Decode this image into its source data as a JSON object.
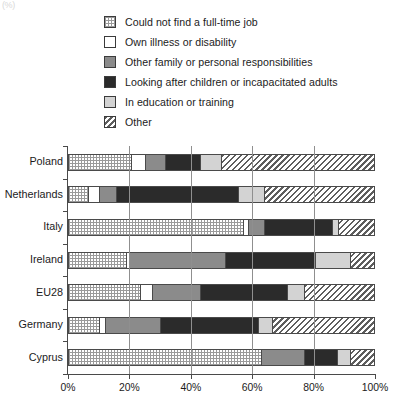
{
  "corner_artifact": "(%)",
  "chart_data": {
    "type": "bar",
    "orientation": "horizontal",
    "stacked": true,
    "normalized": true,
    "title": "",
    "subtitle": "",
    "xlabel": "",
    "ylabel": "",
    "xlim": [
      0,
      100
    ],
    "grid": true,
    "legend_position": "top",
    "xticks": [
      "0%",
      "20%",
      "40%",
      "60%",
      "80%",
      "100%"
    ],
    "xtick_values": [
      0,
      20,
      40,
      60,
      80,
      100
    ],
    "categories": [
      "Poland",
      "Netherlands",
      "Italy",
      "Ireland",
      "EU28",
      "Germany",
      "Cyprus"
    ],
    "series": [
      {
        "name": "Could not find a full-time job",
        "pattern": "dotted",
        "values": [
          20.5,
          6.5,
          57.0,
          19.0,
          23.5,
          10.0,
          63.0
        ]
      },
      {
        "name": "Own illness or disability",
        "pattern": "white",
        "values": [
          4.5,
          3.5,
          1.5,
          1.0,
          4.0,
          2.0,
          0.0
        ]
      },
      {
        "name": "Other family or personal responsibilities",
        "pattern": "gray",
        "values": [
          6.5,
          5.5,
          5.5,
          31.0,
          15.5,
          18.0,
          14.0
        ]
      },
      {
        "name": "Looking after children or incapacitated adults",
        "pattern": "black",
        "values": [
          11.5,
          40.0,
          22.0,
          29.5,
          28.5,
          32.0,
          10.5
        ]
      },
      {
        "name": "In education or training",
        "pattern": "lightgray",
        "values": [
          7.0,
          8.5,
          2.0,
          11.5,
          5.5,
          4.5,
          4.5
        ]
      },
      {
        "name": "Other",
        "pattern": "hatch",
        "values": [
          50.0,
          36.0,
          12.0,
          8.0,
          23.0,
          33.5,
          8.0
        ]
      }
    ]
  },
  "legend": {
    "items": [
      {
        "label": "Could not find a full-time job",
        "pattern": "dotted"
      },
      {
        "label": "Own illness or disability",
        "pattern": "white"
      },
      {
        "label": "Other family or personal responsibilities",
        "pattern": "gray"
      },
      {
        "label": "Looking after children or incapacitated adults",
        "pattern": "black"
      },
      {
        "label": "In education or training",
        "pattern": "lightgray"
      },
      {
        "label": "Other",
        "pattern": "hatch"
      }
    ]
  },
  "colors": {
    "dotted": "#9a9a9a",
    "white": "#ffffff",
    "gray": "#8b8b8b",
    "black": "#2b2b2b",
    "lightgray": "#d3d3d3",
    "hatch": "#5e5e5e",
    "axis": "#4a4a4a",
    "grid": "#8f8f8f",
    "text": "#1b1b1b"
  }
}
